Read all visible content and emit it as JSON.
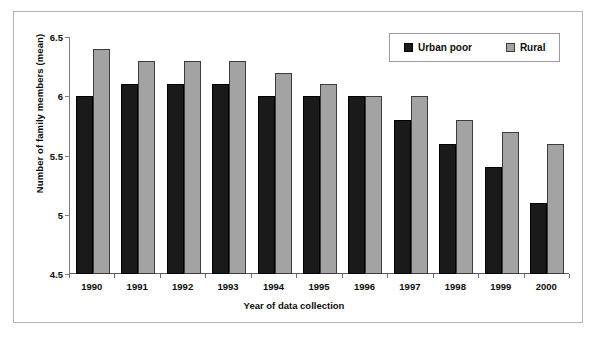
{
  "chart_data": {
    "type": "bar",
    "title": "",
    "xlabel": "Year of data collection",
    "ylabel": "Number of family members (mean)",
    "categories": [
      "1990",
      "1991",
      "1992",
      "1993",
      "1994",
      "1995",
      "1996",
      "1997",
      "1998",
      "1999",
      "2000"
    ],
    "series": [
      {
        "name": "Urban poor",
        "color": "#1a1a1a",
        "values": [
          6.0,
          6.1,
          6.1,
          6.1,
          6.0,
          6.0,
          6.0,
          5.8,
          5.6,
          5.4,
          5.1
        ]
      },
      {
        "name": "Rural",
        "color": "#a3a3a3",
        "values": [
          6.4,
          6.3,
          6.3,
          6.3,
          6.2,
          6.1,
          6.0,
          6.0,
          5.8,
          5.7,
          5.6
        ]
      }
    ],
    "ylim": [
      4.5,
      6.5
    ],
    "yticks": [
      "4.5",
      "5",
      "5.5",
      "6",
      "6.5"
    ],
    "ytick_values": [
      4.5,
      5.0,
      5.5,
      6.0,
      6.5
    ],
    "grid": false,
    "legend_position": "top-right"
  },
  "legend": {
    "items": [
      {
        "label": "Urban poor"
      },
      {
        "label": "Rural"
      }
    ]
  }
}
